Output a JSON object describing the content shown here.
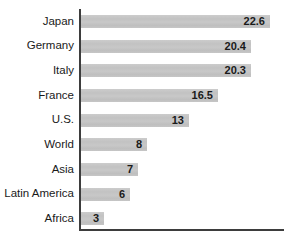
{
  "chart_data": {
    "type": "bar",
    "orientation": "horizontal",
    "title": "",
    "xlabel": "",
    "ylabel": "",
    "categories": [
      "Japan",
      "Germany",
      "Italy",
      "France",
      "U.S.",
      "World",
      "Asia",
      "Latin America",
      "Africa"
    ],
    "values": [
      22.6,
      20.4,
      20.3,
      16.5,
      13,
      8,
      7,
      6,
      3
    ],
    "value_labels": [
      "22.6",
      "20.4",
      "20.3",
      "16.5",
      "13",
      "8",
      "7",
      "6",
      "3"
    ],
    "xlim": [
      0,
      24.3
    ],
    "grid": false,
    "legend": null,
    "value_label_position": "inside-end",
    "bar_color": "#c4c4c4",
    "text_color": "#1a1a1a",
    "axis_color": "#3d3d3d",
    "background_color": "#ffffff"
  }
}
